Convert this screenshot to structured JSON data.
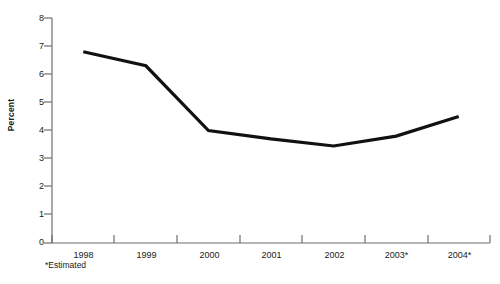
{
  "chart_data": {
    "type": "line",
    "title": "",
    "subtitle": "",
    "xlabel": "",
    "ylabel": "Percent",
    "categories": [
      "1998",
      "1999",
      "2000",
      "2001",
      "2002",
      "2003*",
      "2004*"
    ],
    "values": [
      6.8,
      6.3,
      4.0,
      3.7,
      3.45,
      3.8,
      4.5
    ],
    "series": [
      {
        "name": "Percent",
        "values": [
          6.8,
          6.3,
          4.0,
          3.7,
          3.45,
          3.8,
          4.5
        ]
      }
    ],
    "ylim": [
      0,
      8
    ],
    "yticks": [
      0,
      1,
      2,
      3,
      4,
      5,
      6,
      7,
      8
    ],
    "ytick_labels": [
      "0",
      "1",
      "2",
      "3",
      "4",
      "5",
      "6",
      "7",
      "8"
    ],
    "grid": false,
    "legend": "none",
    "annotations": [
      "*Estimated"
    ],
    "line_color": "#111111",
    "line_width": 3,
    "axis_color": "#6e6e6e",
    "background_color": "#ffffff"
  },
  "axes": {
    "y_axis_title": "Percent",
    "tick_labels_y": [
      "8",
      "7",
      "6",
      "5",
      "4",
      "3",
      "2",
      "1",
      "0"
    ],
    "tick_labels_x": [
      "1998",
      "1999",
      "2000",
      "2001",
      "2002",
      "2003*",
      "2004*"
    ]
  },
  "footnote": {
    "text": "*Estimated"
  }
}
